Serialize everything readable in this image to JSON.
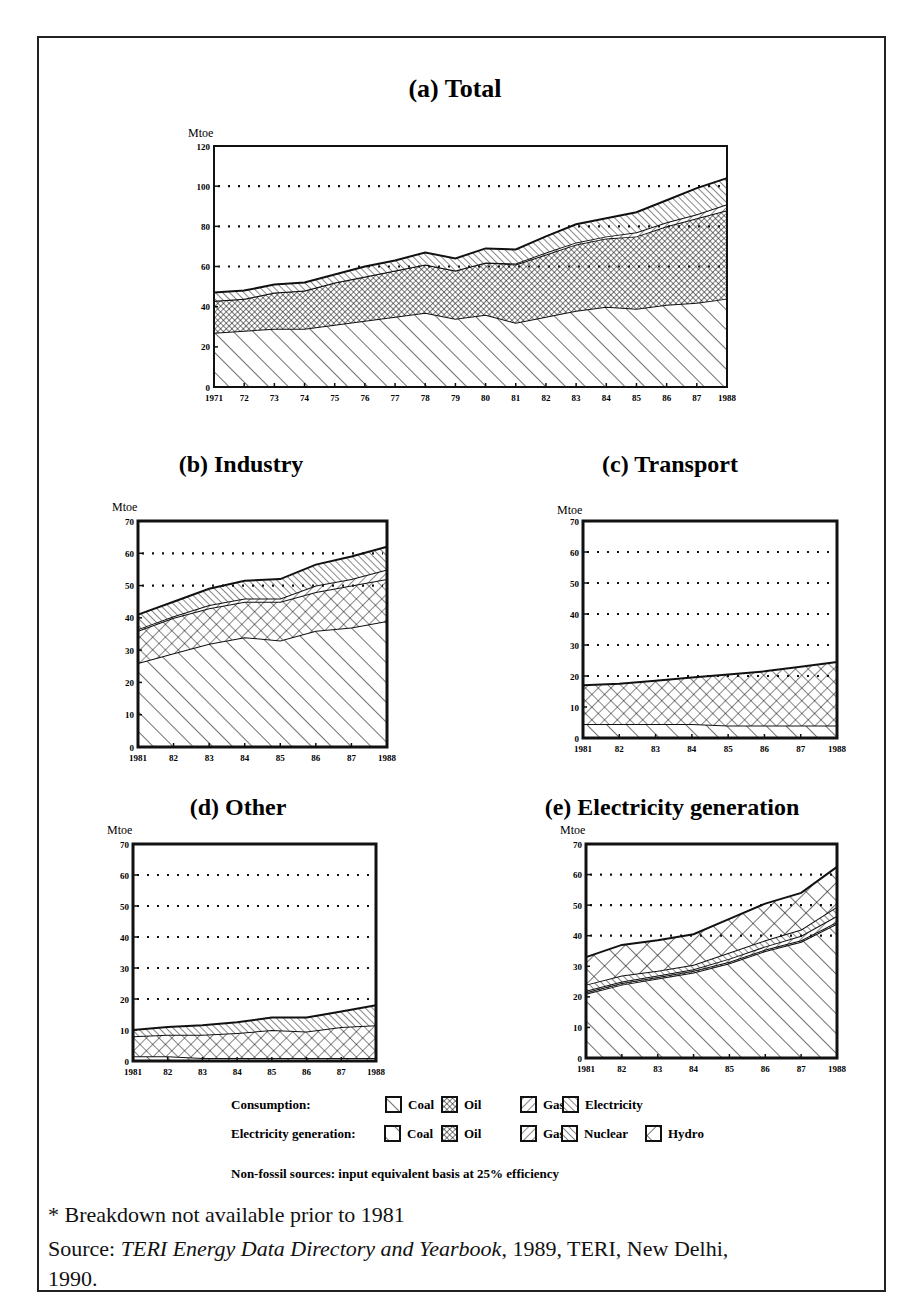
{
  "figure": {
    "footnote": "* Breakdown not available prior to 1981",
    "source_prefix": "Source: ",
    "source_title": "TERI Energy Data Directory and Yearbook",
    "source_suffix": ", 1989, TERI, New Delhi,",
    "source_line2": "1990."
  },
  "legend": {
    "consumption_label": "Consumption:",
    "consumption_items": [
      "Coal",
      "Oil",
      "Gas",
      "Electricity"
    ],
    "generation_label": "Electricity generation:",
    "generation_items": [
      "Coal",
      "Oil",
      "Gas",
      "Nuclear",
      "Hydro"
    ],
    "note": "Non-fossil sources: input equivalent basis at 25% efficiency"
  },
  "chart_data": [
    {
      "id": "a",
      "type": "area",
      "stacked": true,
      "title": "(a) Total",
      "ylabel": "Mtoe",
      "ylim": [
        0,
        120
      ],
      "yticks": [
        0,
        20,
        40,
        60,
        80,
        100,
        120
      ],
      "gridlines": [
        60,
        80,
        100
      ],
      "x": [
        "1971",
        "72",
        "73",
        "74",
        "75",
        "76",
        "77",
        "78",
        "79",
        "80",
        "81",
        "82",
        "83",
        "84",
        "85",
        "86",
        "87",
        "1988"
      ],
      "series": [
        {
          "name": "Coal",
          "pattern": "diag-wide",
          "values": [
            27,
            28,
            29,
            29,
            31,
            33,
            35,
            37,
            34,
            36,
            32,
            35,
            38,
            40,
            39,
            41,
            42,
            44
          ]
        },
        {
          "name": "Oil",
          "pattern": "crosshatch-fine",
          "values": [
            16,
            16,
            18,
            19,
            21,
            22,
            23,
            24,
            24,
            26,
            29,
            31,
            33,
            34,
            36,
            39,
            42,
            44
          ]
        },
        {
          "name": "Gas",
          "pattern": "diag-back",
          "values": [
            0,
            0,
            0,
            0,
            0,
            0,
            0,
            0,
            0,
            0,
            0.5,
            1,
            1,
            1,
            2,
            2,
            2,
            3
          ]
        },
        {
          "name": "Electricity",
          "pattern": "diag-fine",
          "values": [
            4,
            4,
            4,
            4,
            4,
            5,
            5,
            6,
            6,
            7,
            7,
            8,
            9,
            9,
            10,
            11,
            13,
            13
          ]
        }
      ]
    },
    {
      "id": "b",
      "type": "area",
      "stacked": true,
      "title": "(b) Industry",
      "ylabel": "Mtoe",
      "ylim": [
        0,
        70
      ],
      "yticks": [
        0,
        10,
        20,
        30,
        40,
        50,
        60,
        70
      ],
      "gridlines": [
        50,
        60
      ],
      "x": [
        "1981",
        "82",
        "83",
        "84",
        "85",
        "86",
        "87",
        "1988"
      ],
      "series": [
        {
          "name": "Coal",
          "pattern": "diag-wide",
          "values": [
            26,
            29,
            32,
            34,
            33,
            36,
            37,
            39
          ]
        },
        {
          "name": "Oil",
          "pattern": "crosshatch",
          "values": [
            10,
            11,
            11,
            11,
            12,
            12,
            13,
            13
          ]
        },
        {
          "name": "Gas",
          "pattern": "diag-back",
          "values": [
            0.5,
            0.5,
            1,
            1,
            1,
            2,
            2,
            3
          ]
        },
        {
          "name": "Electricity",
          "pattern": "diag-fine",
          "values": [
            4.5,
            4.5,
            5,
            5.5,
            6,
            6.5,
            7,
            7
          ]
        }
      ]
    },
    {
      "id": "c",
      "type": "area",
      "stacked": true,
      "title": "(c) Transport",
      "ylabel": "Mtoe",
      "ylim": [
        0,
        70
      ],
      "yticks": [
        0,
        10,
        20,
        30,
        40,
        50,
        60,
        70
      ],
      "gridlines": [
        20,
        30,
        40,
        50,
        60
      ],
      "x": [
        "1981",
        "82",
        "83",
        "84",
        "85",
        "86",
        "87",
        "1988"
      ],
      "series": [
        {
          "name": "Coal",
          "pattern": "diag-wide",
          "values": [
            4.5,
            4.5,
            4.5,
            4.5,
            4,
            4,
            4,
            4
          ]
        },
        {
          "name": "Oil",
          "pattern": "crosshatch",
          "values": [
            12.5,
            13,
            14,
            15,
            16.5,
            17.5,
            19,
            20.5
          ]
        }
      ]
    },
    {
      "id": "d",
      "type": "area",
      "stacked": true,
      "title": "(d) Other",
      "ylabel": "Mtoe",
      "ylim": [
        0,
        70
      ],
      "yticks": [
        0,
        10,
        20,
        30,
        40,
        50,
        60,
        70
      ],
      "gridlines": [
        20,
        30,
        40,
        50,
        60
      ],
      "x": [
        "1981",
        "82",
        "83",
        "84",
        "85",
        "86",
        "87",
        "1988"
      ],
      "series": [
        {
          "name": "Coal",
          "pattern": "diag-wide",
          "values": [
            1.5,
            1.5,
            1,
            1,
            1,
            1,
            1,
            1
          ]
        },
        {
          "name": "Oil",
          "pattern": "crosshatch",
          "values": [
            6.5,
            7,
            7.5,
            8,
            9,
            8.5,
            10,
            10.5
          ]
        },
        {
          "name": "Electricity",
          "pattern": "diag-fine",
          "values": [
            2,
            2.5,
            3,
            3.5,
            4,
            4.5,
            5,
            6.5
          ]
        }
      ]
    },
    {
      "id": "e",
      "type": "area",
      "stacked": true,
      "title": "(e) Electricity generation",
      "ylabel": "Mtoe",
      "ylim": [
        0,
        70
      ],
      "yticks": [
        0,
        10,
        20,
        30,
        40,
        50,
        60,
        70
      ],
      "gridlines": [
        40,
        50,
        60
      ],
      "x": [
        "1981",
        "82",
        "83",
        "84",
        "85",
        "86",
        "87",
        "1988"
      ],
      "series": [
        {
          "name": "Coal",
          "pattern": "diag-wide",
          "values": [
            21,
            24,
            26,
            28,
            31,
            35,
            38,
            44
          ]
        },
        {
          "name": "Oil",
          "pattern": "crosshatch-fine",
          "values": [
            0.5,
            0.5,
            0.5,
            0.5,
            0.5,
            0.5,
            0.5,
            0.5
          ]
        },
        {
          "name": "Gas",
          "pattern": "diag-back",
          "values": [
            0.5,
            0.5,
            0.5,
            0.5,
            1,
            1,
            1.5,
            2
          ]
        },
        {
          "name": "Nuclear",
          "pattern": "diag-fine",
          "values": [
            2,
            2,
            1.5,
            1.5,
            2,
            2,
            2,
            3
          ]
        },
        {
          "name": "Hydro",
          "pattern": "crosshatch-coarse",
          "values": [
            9,
            10,
            10,
            10,
            11,
            12,
            12,
            13
          ]
        }
      ]
    }
  ]
}
